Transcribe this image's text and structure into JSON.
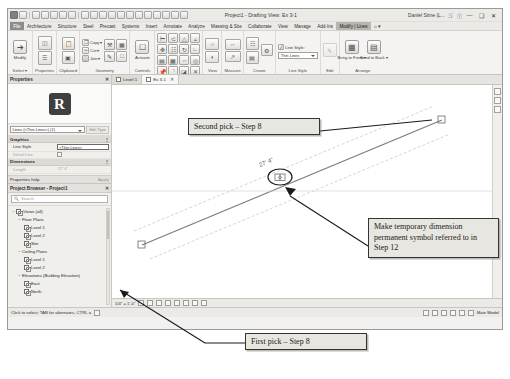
{
  "window": {
    "title": "Project1 - Drafting View: Ex 3-1",
    "user": "Daniel Stine (L...",
    "search_placeholder": "Type a keyword or phrase",
    "minimize": "—",
    "maximize": "❑",
    "close": "✕",
    "help_icon": "question-icon",
    "cart_icon": "cart-icon"
  },
  "quick_access": {
    "icons": [
      "app-menu-icon",
      "new-icon",
      "open-icon",
      "save-icon",
      "save-as-icon",
      "undo-icon",
      "redo-icon",
      "print-icon",
      "measure-icon",
      "aligned-dimension-icon",
      "tag-icon",
      "text-icon",
      "model-text-icon",
      "default-3d-view-icon",
      "section-icon",
      "thin-lines-icon",
      "close-hidden-windows-icon",
      "switch-window-icon",
      "customize-icon"
    ]
  },
  "ribbon": {
    "tabs": [
      {
        "label": "File",
        "state": "file"
      },
      {
        "label": "Architecture",
        "state": ""
      },
      {
        "label": "Structure",
        "state": ""
      },
      {
        "label": "Steel",
        "state": ""
      },
      {
        "label": "Precast",
        "state": ""
      },
      {
        "label": "Systems",
        "state": ""
      },
      {
        "label": "Insert",
        "state": ""
      },
      {
        "label": "Annotate",
        "state": ""
      },
      {
        "label": "Analyze",
        "state": ""
      },
      {
        "label": "Massing & Site",
        "state": ""
      },
      {
        "label": "Collaborate",
        "state": ""
      },
      {
        "label": "View",
        "state": ""
      },
      {
        "label": "Manage",
        "state": ""
      },
      {
        "label": "Add-Ins",
        "state": ""
      },
      {
        "label": "Modify | Lines",
        "state": "ctx"
      },
      {
        "label": "⌂ ▾",
        "state": ""
      }
    ],
    "panels": {
      "select": {
        "label": "Select ▾",
        "button": "Modify",
        "icon": "arrow-cursor-icon"
      },
      "properties": {
        "label": "Properties",
        "buttons": [
          "properties-icon",
          "type-properties-icon"
        ]
      },
      "clipboard": {
        "label": "Clipboard",
        "buttons": [
          "paste-icon",
          "cut-icon",
          "copy-icon",
          "match-type-icon"
        ],
        "items": [
          "Copy",
          "Cut",
          "Join"
        ]
      },
      "geometry": {
        "label": "Geometry",
        "items": [
          "Copy ▾",
          "Cut ▾",
          "Join ▾"
        ]
      },
      "controls": {
        "label": "Controls",
        "button": "Activate",
        "icon": "activate-icon"
      },
      "modify": {
        "label": "Modify",
        "icons": [
          "align-icon",
          "offset-icon",
          "mirror-pick-icon",
          "mirror-axis-icon",
          "move-icon",
          "copy-icon",
          "rotate-icon",
          "trim-icon",
          "split-icon",
          "array-icon",
          "scale-icon",
          "pin-icon",
          "delete-icon"
        ]
      },
      "view": {
        "label": "View",
        "icons": [
          "show-hidden-icon",
          "hide-reveal-icon"
        ]
      },
      "measure": {
        "label": "Measure",
        "icons": [
          "measure-icon",
          "measure-between-icon"
        ]
      },
      "create": {
        "label": "Create",
        "icons": [
          "create-group-icon",
          "create-part-icon",
          "create-similar-icon"
        ]
      },
      "linestyle": {
        "label": "Line Style",
        "field_label": "Line Style:",
        "value": "Thin Lines"
      },
      "edit": {
        "label": "Edit",
        "icon": "edit-sketch-icon"
      },
      "arrange": {
        "label": "Arrange",
        "buttons": [
          {
            "label": "Bring to Front ▾",
            "icon": "bring-to-front-icon"
          },
          {
            "label": "Send to Back ▾",
            "icon": "send-to-back-icon"
          }
        ]
      }
    }
  },
  "properties_palette": {
    "title": "Properties",
    "close": "✕",
    "type_selector": "Lines (<Thin Lines>) (1)",
    "edit_type": "Edit Type",
    "groups": [
      {
        "name": "Graphics",
        "rows": [
          {
            "key": "Line Style",
            "value": "<Thin Lines>",
            "kind": "combo"
          },
          {
            "key": "Detail Line",
            "value": "",
            "kind": "checkbox"
          }
        ]
      },
      {
        "name": "Dimensions",
        "rows": [
          {
            "key": "Length",
            "value": "27' 4\"",
            "kind": "text"
          }
        ]
      }
    ],
    "footer": {
      "help": "Properties help",
      "apply": "Apply"
    }
  },
  "project_browser": {
    "title": "Project Browser - Project1",
    "close": "✕",
    "search_placeholder": "Search",
    "tree": [
      {
        "label": "Views (all)",
        "level": 1,
        "expander": "−",
        "icon": "views-icon"
      },
      {
        "label": "Floor Plans",
        "level": 2,
        "expander": "−",
        "icon": "folder-icon"
      },
      {
        "label": "Level 1",
        "level": 3,
        "expander": "",
        "icon": "view-icon"
      },
      {
        "label": "Level 2",
        "level": 3,
        "expander": "",
        "icon": "view-icon"
      },
      {
        "label": "Site",
        "level": 3,
        "expander": "",
        "icon": "view-icon"
      },
      {
        "label": "Ceiling Plans",
        "level": 2,
        "expander": "−",
        "icon": "folder-icon"
      },
      {
        "label": "Level 1",
        "level": 3,
        "expander": "",
        "icon": "view-icon"
      },
      {
        "label": "Level 2",
        "level": 3,
        "expander": "",
        "icon": "view-icon"
      },
      {
        "label": "Elevations (Building Elevation)",
        "level": 2,
        "expander": "−",
        "icon": "folder-icon"
      },
      {
        "label": "East",
        "level": 3,
        "expander": "",
        "icon": "view-icon"
      },
      {
        "label": "North",
        "level": 3,
        "expander": "",
        "icon": "view-icon"
      }
    ]
  },
  "view_tabs": [
    {
      "label": "Level 1",
      "active": false,
      "close": ""
    },
    {
      "label": "Ex 3-1",
      "active": true,
      "close": "✕"
    }
  ],
  "canvas": {
    "temp_dimension": "27' 4\"",
    "make_permanent_icon": "make-dimension-permanent-icon"
  },
  "view_control_bar": {
    "scale": "1/4\" = 1'-0\"",
    "icons": [
      "detail-level-icon",
      "visual-style-icon",
      "sun-path-icon",
      "shadows-icon",
      "render-icon",
      "crop-view-icon",
      "crop-region-icon",
      "analytical-model-icon"
    ]
  },
  "status_bar": {
    "message": "Click to select; TAB for alternates, CTRL a",
    "right_label": "Main Model",
    "icons": [
      "filter-icon",
      "warning-icon",
      "select-links-icon",
      "select-underlay-icon",
      "select-pinned-icon",
      "select-by-face-icon",
      "drag-elements-icon"
    ]
  },
  "annotations": {
    "second_pick": "Second pick – Step 8",
    "make_permanent": "Make temporary dimension permanent symbol referred to in Step 12",
    "first_pick": "First pick – Step 8"
  },
  "colors": {
    "ribbon_bg": "#f4f3f1",
    "chrome_bg": "#eceae7",
    "callout_bg": "#e8e6e1",
    "callout_border": "#35352f",
    "canvas_bg": "#ffffff",
    "line_color": "#9a9a9a"
  }
}
